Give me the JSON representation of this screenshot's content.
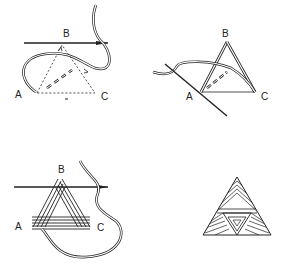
{
  "diagram": {
    "type": "embroidery-stitch-instructions",
    "ink_color": "#222222",
    "background": "#ffffff",
    "panels": [
      {
        "id": "step-1",
        "description": "Needle inserted horizontally at B; thread loops around; dotted triangle ABC with dashed path",
        "labels": {
          "a": "A",
          "b": "B",
          "c": "C"
        }
      },
      {
        "id": "step-2",
        "description": "Needle diagonal through A; thread laid from A to B and B to C",
        "labels": {
          "a": "A",
          "b": "B",
          "c": "C"
        }
      },
      {
        "id": "step-3",
        "description": "Multiple wraps forming triangle outline; needle horizontal at B",
        "labels": {
          "a": "A",
          "b": "B",
          "c": "C"
        }
      },
      {
        "id": "step-4",
        "description": "Finished satin-stitched triangle with inner inverted triangle",
        "labels": {}
      }
    ]
  }
}
